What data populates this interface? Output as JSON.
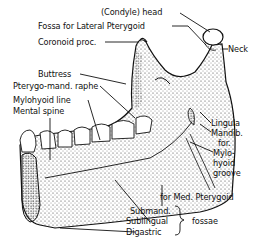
{
  "figure": {
    "colors": {
      "ink": "#111111",
      "background": "#ffffff",
      "stipple": "#333333"
    }
  },
  "labels": {
    "condyle_head": "(Condyle) head",
    "fossa_lateral_pterygoid": "Fossa for Lateral Pterygoid",
    "coronoid_proc": "Coronoid proc.",
    "neck": "Neck",
    "buttress": "Buttress",
    "pterygo_mand_raphe": "Pterygo-mand. raphe",
    "mylohyoid_line": "Mylohyoid line",
    "mental_spine": "Mental spine",
    "lingula": "Lingula",
    "mandib_for_1": "Mandib.",
    "mandib_for_2": "for.",
    "mylohyoid_groove_1": "Mylo-",
    "mylohyoid_groove_2": "hyoid",
    "mylohyoid_groove_3": "groove",
    "for_med_pterygoid": "for Med. Pterygoid",
    "submand": "Submand.",
    "sublingual": "Sublingual",
    "digastric": "Digastric",
    "fossae": "fossae"
  }
}
